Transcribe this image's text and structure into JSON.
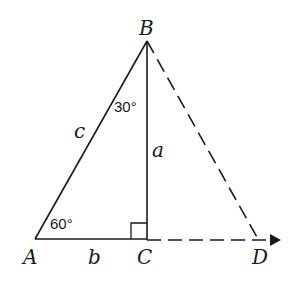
{
  "diagram": {
    "vertices": {
      "A": "A",
      "B": "B",
      "C": "C",
      "D": "D"
    },
    "sides": {
      "c": "c",
      "a": "a",
      "b": "b"
    },
    "angles": {
      "at_B": "30°",
      "at_A": "60°"
    },
    "right_angle_at": "C",
    "line_color": "#1a1a1a"
  }
}
